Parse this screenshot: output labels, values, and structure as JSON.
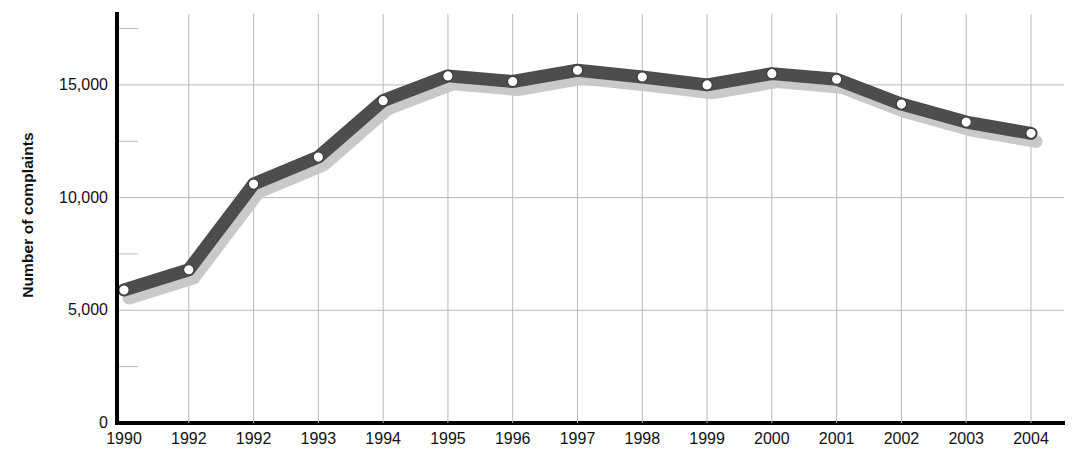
{
  "chart_data": {
    "type": "line",
    "title": "",
    "xlabel": "",
    "ylabel": "Number of complaints",
    "categories": [
      "1990",
      "1992",
      "1992",
      "1993",
      "1994",
      "1995",
      "1996",
      "1997",
      "1998",
      "1999",
      "2000",
      "2001",
      "2002",
      "2003",
      "2004"
    ],
    "values": [
      5900,
      6800,
      10600,
      11800,
      14300,
      15400,
      15150,
      15650,
      15350,
      15000,
      15500,
      15250,
      14150,
      13350,
      12850
    ],
    "series": [
      {
        "name": "Number of complaints",
        "values": [
          5900,
          6800,
          10600,
          11800,
          14300,
          15400,
          15150,
          15650,
          15350,
          15000,
          15500,
          15250,
          14150,
          13350,
          12850
        ]
      }
    ],
    "ylim": [
      0,
      17500
    ],
    "y_ticks": [
      0,
      5000,
      10000,
      15000
    ],
    "y_tick_labels": [
      "0",
      "5,000",
      "10,000",
      "15,000"
    ],
    "y_minor_ticks": [
      2500,
      7500,
      12500,
      17500
    ],
    "grid": true,
    "grid_x": true,
    "grid_y": true,
    "legend": "none",
    "marker": "circle",
    "marker_fill": "#ffffff",
    "marker_edge": "#3a3a3a",
    "line_color": "#4d4d4d",
    "shadow_color": "#c9c9c9",
    "grid_color": "#b9b9b9",
    "axis_color": "#000000"
  },
  "axes": {
    "y_title": "Number of complaints"
  }
}
